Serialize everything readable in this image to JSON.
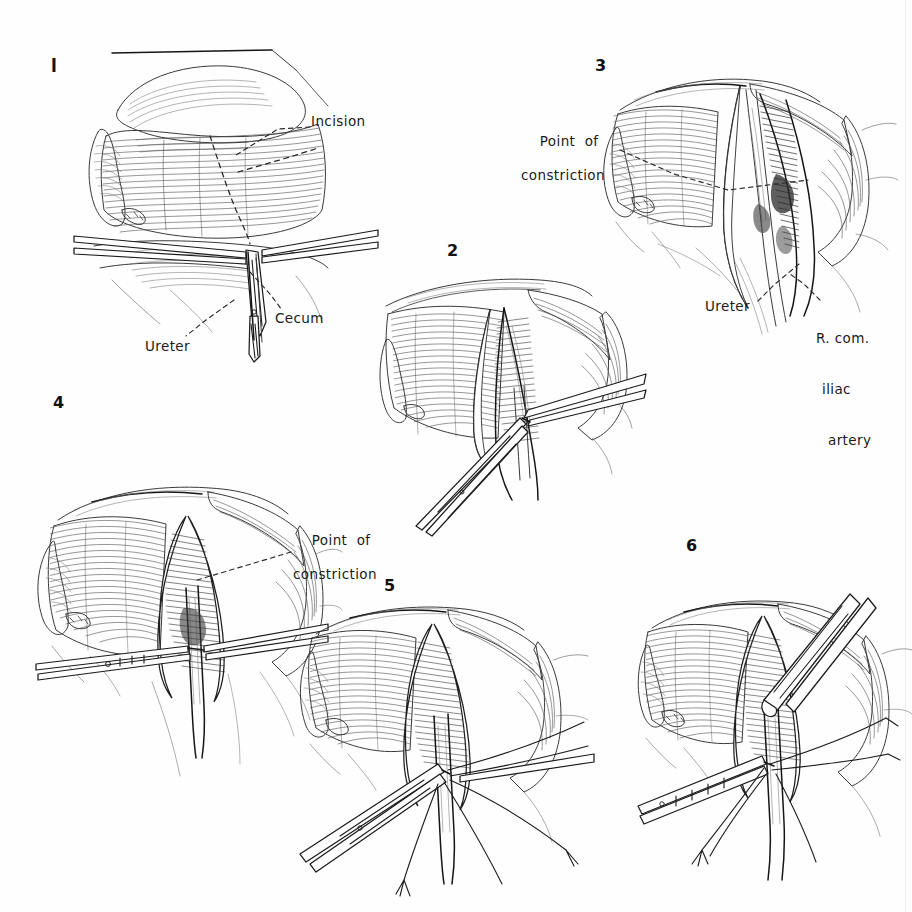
{
  "plate": {
    "medium": "pen-and-ink surgical illustration",
    "subject": "Operative exposure and division of the right ureter at the point of constriction over the right common iliac artery",
    "background_color": "#fefefe",
    "ink_color": "#2a2a2a",
    "panel_count": 6
  },
  "panels": [
    {
      "number": "1",
      "number_style": "roman-bar",
      "labels": [
        {
          "text": "Incision",
          "lines": [
            "Incision"
          ]
        },
        {
          "text": "Cecum",
          "lines": [
            "Cecum"
          ]
        },
        {
          "text": "Ureter",
          "lines": [
            "Ureter"
          ]
        }
      ]
    },
    {
      "number": "2",
      "number_style": "arabic",
      "labels": []
    },
    {
      "number": "3",
      "number_style": "arabic",
      "labels": [
        {
          "text": "Point of constriction",
          "lines": [
            "Point  of",
            "constriction"
          ]
        },
        {
          "text": "Ureter",
          "lines": [
            "Ureter"
          ]
        },
        {
          "text": "R. com. iliac artery",
          "lines": [
            "R. com.",
            "iliac",
            "artery"
          ]
        }
      ]
    },
    {
      "number": "4",
      "number_style": "arabic",
      "labels": [
        {
          "text": "Point of constriction",
          "lines": [
            "Point  of",
            "constriction"
          ]
        }
      ]
    },
    {
      "number": "5",
      "number_style": "arabic",
      "labels": []
    },
    {
      "number": "6",
      "number_style": "arabic",
      "labels": []
    }
  ],
  "text": {
    "fig1_num": "l",
    "fig2_num": "2",
    "fig3_num": "3",
    "fig4_num": "4",
    "fig5_num": "5",
    "fig6_num": "6",
    "incision": "Incision",
    "cecum": "Cecum",
    "ureter_1": "Ureter",
    "poc3_l1": "Point  of",
    "poc3_l2": "constriction",
    "ureter_3": "Ureter",
    "artery_l1": "R. com.",
    "artery_l2": "iliac",
    "artery_l3": "artery",
    "poc4_l1": "Point  of",
    "poc4_l2": "constriction"
  }
}
